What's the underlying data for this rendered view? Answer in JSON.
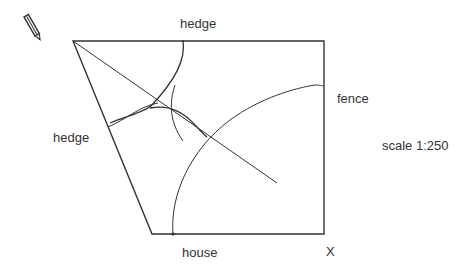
{
  "labels": {
    "hedge_top": "hedge",
    "hedge_left": "hedge",
    "fence": "fence",
    "scale": "scale 1:250",
    "house": "house",
    "x_mark": "X"
  },
  "icons": {
    "pencil": "pencil-icon"
  },
  "colors": {
    "line": "#333333",
    "text": "#333333",
    "background": "#ffffff"
  }
}
